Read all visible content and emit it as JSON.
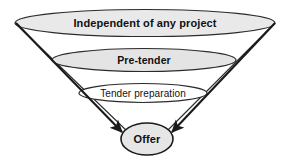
{
  "diagram": {
    "type": "funnel",
    "background_color": "#ffffff",
    "outline_color": "#1a1a1a",
    "stages": [
      {
        "id": "stage-independent",
        "label": "Independent of any project",
        "fill": "#e9e9e9",
        "weight": "bold",
        "font_size": 11,
        "cx": 145,
        "cy": 23,
        "rx": 130,
        "ry": 13.5
      },
      {
        "id": "stage-pre-tender",
        "label": "Pre-tender",
        "fill": "#e4e4e4",
        "weight": "bold",
        "font_size": 10.5,
        "cx": 144,
        "cy": 60,
        "rx": 92,
        "ry": 11.5
      },
      {
        "id": "stage-tender-preparation",
        "label": "Tender preparation",
        "fill": "#ffffff",
        "weight": "normal",
        "font_size": 10,
        "cx": 143,
        "cy": 93,
        "rx": 64,
        "ry": 9.5
      },
      {
        "id": "stage-offer",
        "label": "Offer",
        "fill": "#e6e6e6",
        "weight": "bold",
        "font_size": 11,
        "cx": 147,
        "cy": 139,
        "rx": 26,
        "ry": 16
      }
    ],
    "arrows": [
      {
        "id": "arrow-left",
        "from_x": 16,
        "from_y": 23,
        "to_x": 124,
        "to_y": 134,
        "color": "#1a1a1a"
      },
      {
        "id": "arrow-right",
        "from_x": 275,
        "from_y": 23,
        "to_x": 170,
        "to_y": 134,
        "color": "#1a1a1a"
      }
    ]
  }
}
